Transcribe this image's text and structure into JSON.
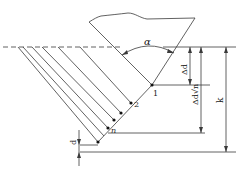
{
  "diagram": {
    "type": "thread-cutting infeed geometry",
    "colors": {
      "line": "#3a3a3a",
      "background": "#ffffff",
      "point": "#111111"
    },
    "labels": {
      "angle": "α",
      "delta_d": "Δd",
      "delta_d_sqrt_n": "Δd√n",
      "sqrt_n": "n",
      "k": "k",
      "d": "d",
      "point_1": "1",
      "point_2": "2",
      "point_n": "n"
    },
    "points": [
      {
        "label": "1",
        "x": 152,
        "y": 85
      },
      {
        "label": "2",
        "x": 131,
        "y": 103
      },
      {
        "label": "",
        "x": 121,
        "y": 113
      },
      {
        "label": "",
        "x": 114,
        "y": 120
      },
      {
        "label": "n",
        "x": 108,
        "y": 128
      },
      {
        "label": "",
        "x": 98,
        "y": 142
      }
    ]
  }
}
